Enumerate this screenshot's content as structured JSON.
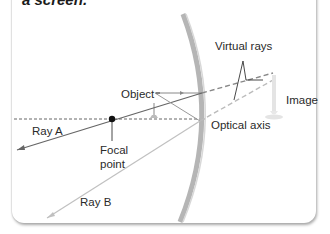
{
  "caption": "a screen.",
  "labels": {
    "virtual_rays": "Virtual rays",
    "object": "Object",
    "image": "Image",
    "optical_axis": "Optical axis",
    "ray_a": "Ray A",
    "focal_point_line1": "Focal",
    "focal_point_line2": "point",
    "ray_b": "Ray B"
  },
  "colors": {
    "mirror": "#b0b0b0",
    "ray_a": "#666666",
    "ray_b": "#bbbbbb",
    "axis": "#555555",
    "virtual": "#888888"
  }
}
